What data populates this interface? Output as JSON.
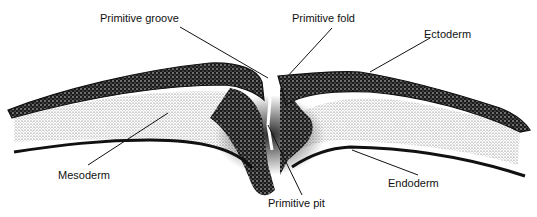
{
  "figure": {
    "labels": {
      "primitive_groove": "Primitive groove",
      "primitive_fold": "Primitive fold",
      "ectoderm": "Ectoderm",
      "mesoderm": "Mesoderm",
      "primitive_pit": "Primitive pit",
      "endoderm": "Endoderm"
    },
    "colors": {
      "ink": "#111111",
      "background": "#ffffff",
      "stipple": "#555555"
    }
  }
}
